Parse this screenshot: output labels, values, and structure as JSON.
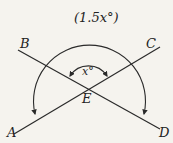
{
  "diagram": {
    "type": "intersecting-lines-angles",
    "points": {
      "A": "A",
      "B": "B",
      "C": "C",
      "D": "D",
      "E": "E"
    },
    "labels": {
      "outer_angle": "(1.5x°)",
      "inner_angle": "x°"
    },
    "colors": {
      "stroke": "#2a2a2a",
      "background": "#f5f3ee"
    }
  }
}
